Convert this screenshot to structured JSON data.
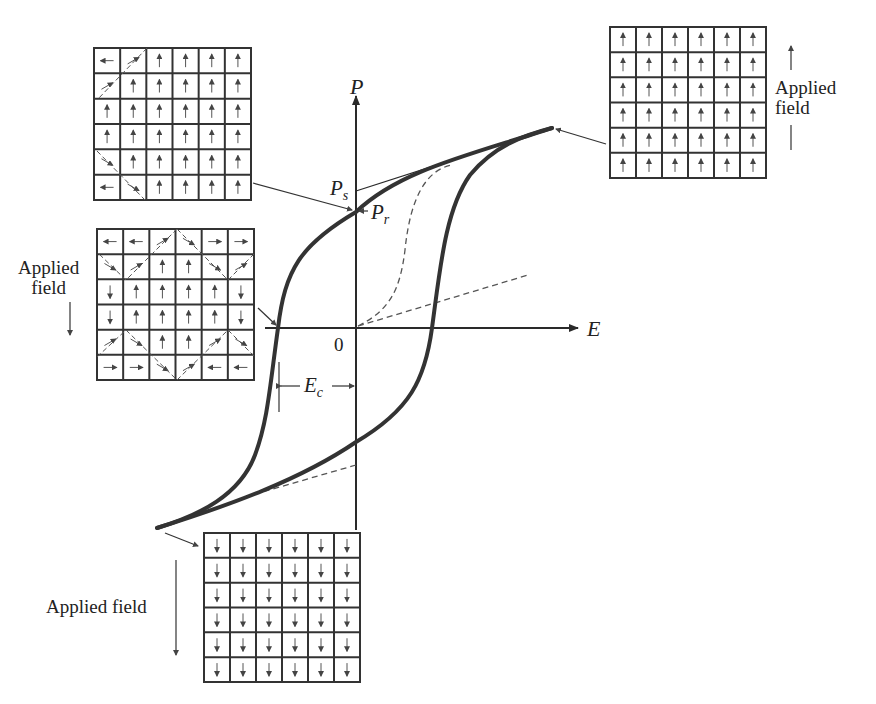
{
  "figure": {
    "type": "ferroelectric hysteresis loop with domain diagrams",
    "colors": {
      "ink": "#2a2a2a",
      "curve": "#333333",
      "dashed": "#555555",
      "background": "#ffffff"
    }
  },
  "axes": {
    "y_label": "P",
    "x_label": "E",
    "origin_label": "0"
  },
  "annotations": {
    "saturation": "P",
    "saturation_sub": "s",
    "remanent": "P",
    "remanent_sub": "r",
    "coercive": "E",
    "coercive_sub": "c"
  },
  "field_labels": {
    "top_right": {
      "line1": "Applied",
      "line2": "field",
      "direction": "up"
    },
    "middle_left": {
      "line1": "Applied",
      "line2": "field",
      "direction": "down"
    },
    "bottom": {
      "text": "Applied field",
      "direction": "down"
    }
  },
  "domain_grids": {
    "top_left": {
      "state": "remanent (near P_r)",
      "rows": [
        [
          "left",
          "diag-up",
          "up",
          "up",
          "up",
          "up"
        ],
        [
          "diag-up",
          "up",
          "up",
          "up",
          "up",
          "up"
        ],
        [
          "up",
          "up",
          "up",
          "up",
          "up",
          "up"
        ],
        [
          "up",
          "up",
          "up",
          "up",
          "up",
          "up"
        ],
        [
          "diag-down",
          "up",
          "up",
          "up",
          "up",
          "up"
        ],
        [
          "left",
          "diag-down",
          "up",
          "up",
          "up",
          "up"
        ]
      ]
    },
    "middle_left": {
      "state": "coercive point (mixed domains)",
      "rows": [
        [
          "left",
          "left",
          "diag-up",
          "diag-down",
          "right",
          "right"
        ],
        [
          "diag-down",
          "diag-up",
          "up",
          "up",
          "diag-down",
          "diag-up"
        ],
        [
          "down",
          "up",
          "up",
          "up",
          "up",
          "down"
        ],
        [
          "down",
          "up",
          "up",
          "up",
          "up",
          "down"
        ],
        [
          "diag-up",
          "diag-down",
          "up",
          "up",
          "diag-up",
          "diag-down"
        ],
        [
          "right",
          "right",
          "diag-down",
          "diag-up",
          "left",
          "left"
        ]
      ]
    },
    "top_right": {
      "state": "positive saturation",
      "rows": [
        [
          "up",
          "up",
          "up",
          "up",
          "up",
          "up"
        ],
        [
          "up",
          "up",
          "up",
          "up",
          "up",
          "up"
        ],
        [
          "up",
          "up",
          "up",
          "up",
          "up",
          "up"
        ],
        [
          "up",
          "up",
          "up",
          "up",
          "up",
          "up"
        ],
        [
          "up",
          "up",
          "up",
          "up",
          "up",
          "up"
        ],
        [
          "up",
          "up",
          "up",
          "up",
          "up",
          "up"
        ]
      ]
    },
    "bottom": {
      "state": "negative saturation",
      "rows": [
        [
          "down",
          "down",
          "down",
          "down",
          "down",
          "down"
        ],
        [
          "down",
          "down",
          "down",
          "down",
          "down",
          "down"
        ],
        [
          "down",
          "down",
          "down",
          "down",
          "down",
          "down"
        ],
        [
          "down",
          "down",
          "down",
          "down",
          "down",
          "down"
        ],
        [
          "down",
          "down",
          "down",
          "down",
          "down",
          "down"
        ],
        [
          "down",
          "down",
          "down",
          "down",
          "down",
          "down"
        ]
      ]
    }
  }
}
